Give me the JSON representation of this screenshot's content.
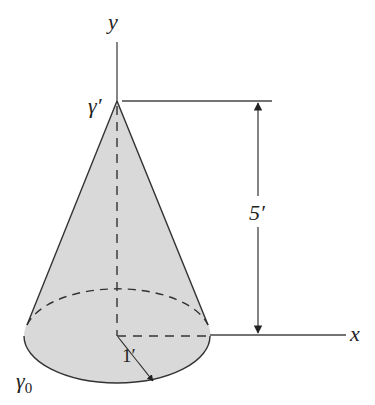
{
  "figure": {
    "type": "cone-diagram",
    "fill_color": "#d9d9d9",
    "line_color": "#333333",
    "labels": {
      "y_axis": "y",
      "x_axis": "x",
      "apex": "γ′",
      "base_curve": "γ",
      "base_curve_subscript": "0",
      "height": "5′",
      "radius": "1′"
    },
    "dimensions": {
      "height_ft": 5,
      "radius_ft": 1
    }
  }
}
